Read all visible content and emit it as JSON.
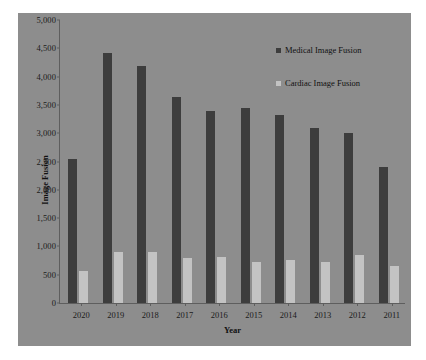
{
  "chart_data": {
    "type": "bar",
    "title": "",
    "xlabel": "Year",
    "ylabel": "Image Fusion",
    "categories": [
      "2020",
      "2019",
      "2018",
      "2017",
      "2016",
      "2015",
      "2014",
      "2013",
      "2012",
      "2011"
    ],
    "series": [
      {
        "name": "Medical Image Fusion",
        "color": "#3d3d3d",
        "values": [
          2550,
          4420,
          4180,
          3640,
          3400,
          3440,
          3330,
          3100,
          3000,
          2400
        ]
      },
      {
        "name": "Cardiac Image Fusion",
        "color": "#c3c3c3",
        "values": [
          570,
          900,
          900,
          800,
          810,
          730,
          760,
          730,
          840,
          650
        ]
      }
    ],
    "ylim": [
      0,
      5000
    ],
    "ytick_labels": [
      "5,000",
      "4,500",
      "4,000",
      "3,500",
      "3,000",
      "2,500",
      "2,000",
      "1,500",
      "1,000",
      "500",
      "0"
    ],
    "ytick_values": [
      5000,
      4500,
      4000,
      3500,
      3000,
      2500,
      2000,
      1500,
      1000,
      500,
      0
    ],
    "grid": false,
    "legend_position": "top-right",
    "plot_background": "#8d8d8d",
    "axis_color": "#5e5e5e"
  }
}
